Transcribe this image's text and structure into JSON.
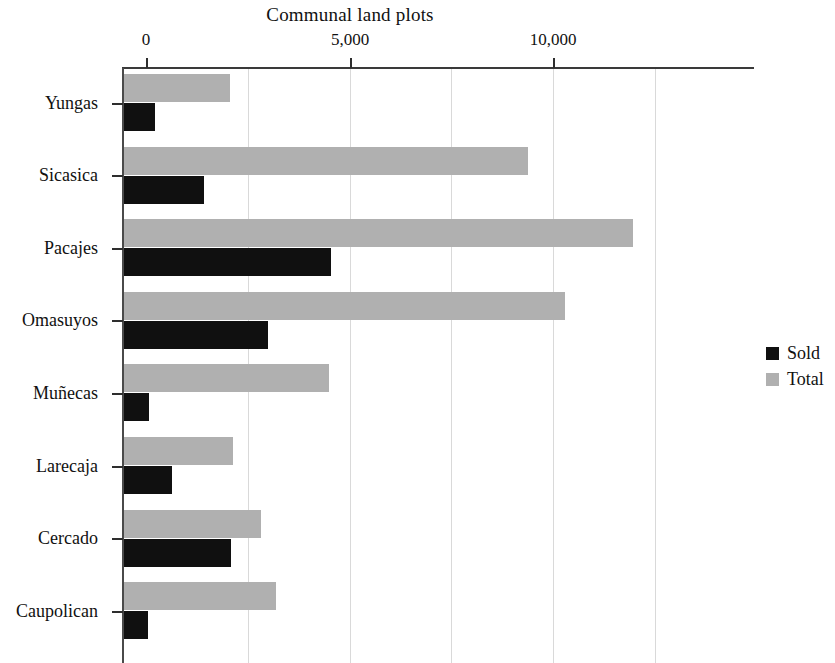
{
  "chart_data": {
    "type": "bar",
    "orientation": "horizontal",
    "title": "Communal land plots",
    "xlabel": "",
    "ylabel": "",
    "xlim": [
      0,
      12700
    ],
    "xticks": [
      0,
      5000,
      10000
    ],
    "xtick_labels": [
      "0",
      "5,000",
      "10,000"
    ],
    "gridlines": [
      2500,
      5000,
      7500,
      10000,
      12500
    ],
    "grid": true,
    "legend_position": "right",
    "categories": [
      "Yungas",
      "Sicasica",
      "Pacajes",
      "Omasuyos",
      "Muñecas",
      "Larecaja",
      "Cercado",
      "Caupolican"
    ],
    "series": [
      {
        "name": "Sold",
        "color": "#101010",
        "values": [
          220,
          1425,
          4545,
          3000,
          75,
          640,
          2090,
          50
        ]
      },
      {
        "name": "Total",
        "color": "#b0b0b0",
        "values": [
          2065,
          9385,
          11965,
          10295,
          4495,
          2140,
          2825,
          3195
        ]
      }
    ]
  },
  "legend": {
    "items": [
      {
        "label": "Sold",
        "color": "#101010"
      },
      {
        "label": "Total",
        "color": "#b0b0b0"
      }
    ]
  }
}
